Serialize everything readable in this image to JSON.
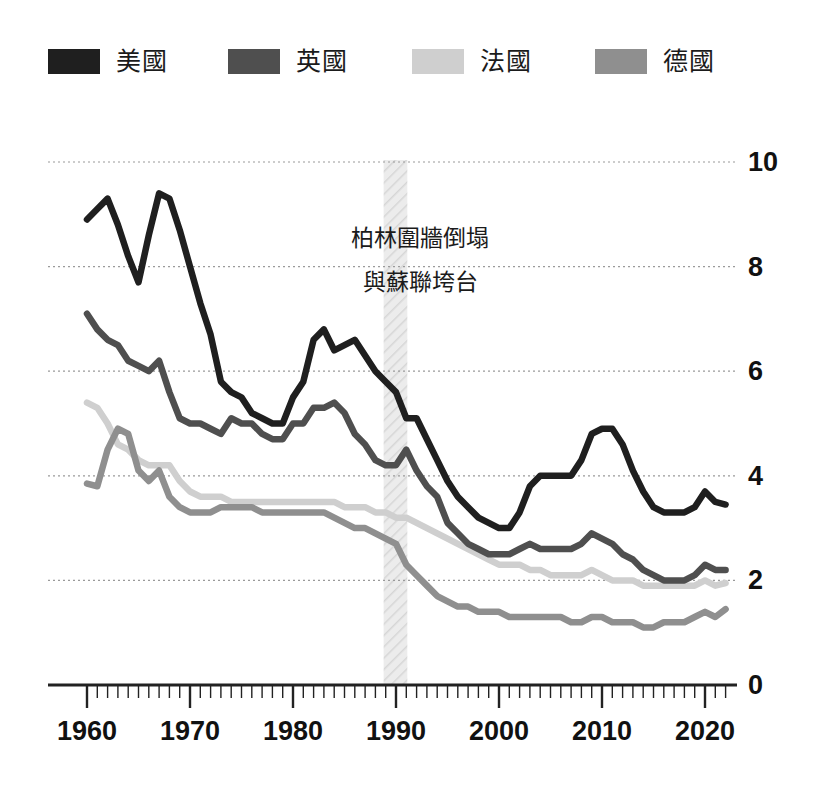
{
  "legend": {
    "items": [
      {
        "label": "美國",
        "color": "#1f1f1f",
        "key": "usa"
      },
      {
        "label": "英國",
        "color": "#4f4f4f",
        "key": "uk"
      },
      {
        "label": "法國",
        "color": "#cfcfcf",
        "key": "france"
      },
      {
        "label": "德國",
        "color": "#8f8f8f",
        "key": "germany"
      }
    ]
  },
  "annotation": {
    "line1": "柏林圍牆倒塌",
    "line2": "與蘇聯垮台",
    "band_start": 1988.8,
    "band_end": 1991.1,
    "band_color": "#e2e2e2"
  },
  "axes": {
    "y_ticks": [
      "0",
      "2",
      "4",
      "6",
      "8",
      "10"
    ],
    "x_ticks": [
      "1960",
      "1970",
      "1980",
      "1990",
      "2000",
      "2010",
      "2020"
    ]
  },
  "chart_data": {
    "type": "line",
    "title": "",
    "subtitle": "",
    "xlabel": "",
    "ylabel": "",
    "xlim": [
      1959.5,
      2022.5
    ],
    "ylim": [
      0,
      10
    ],
    "y_ticks": [
      0,
      2,
      4,
      6,
      8,
      10
    ],
    "x_ticks": [
      1960,
      1970,
      1980,
      1990,
      2000,
      2010,
      2020
    ],
    "x_minor_tick_step": 1,
    "grid": "horizontal-dotted",
    "legend_position": "top",
    "annotations": [
      {
        "text": "柏林圍牆倒塌 與蘇聯垮台",
        "type": "vertical-band",
        "x_start": 1988.8,
        "x_end": 1991.1
      }
    ],
    "x": [
      1960,
      1961,
      1962,
      1963,
      1964,
      1965,
      1966,
      1967,
      1968,
      1969,
      1970,
      1971,
      1972,
      1973,
      1974,
      1975,
      1976,
      1977,
      1978,
      1979,
      1980,
      1981,
      1982,
      1983,
      1984,
      1985,
      1986,
      1987,
      1988,
      1989,
      1990,
      1991,
      1992,
      1993,
      1994,
      1995,
      1996,
      1997,
      1998,
      1999,
      2000,
      2001,
      2002,
      2003,
      2004,
      2005,
      2006,
      2007,
      2008,
      2009,
      2010,
      2011,
      2012,
      2013,
      2014,
      2015,
      2016,
      2017,
      2018,
      2019,
      2020,
      2021,
      2022
    ],
    "series": [
      {
        "name": "美國",
        "color": "#1f1f1f",
        "values": [
          8.9,
          9.1,
          9.3,
          8.8,
          8.2,
          7.7,
          8.6,
          9.4,
          9.3,
          8.7,
          8.0,
          7.3,
          6.7,
          5.8,
          5.6,
          5.5,
          5.2,
          5.1,
          5.0,
          5.0,
          5.5,
          5.8,
          6.6,
          6.8,
          6.4,
          6.5,
          6.6,
          6.3,
          6.0,
          5.8,
          5.6,
          5.1,
          5.1,
          4.7,
          4.3,
          3.9,
          3.6,
          3.4,
          3.2,
          3.1,
          3.0,
          3.0,
          3.3,
          3.8,
          4.0,
          4.0,
          4.0,
          4.0,
          4.3,
          4.8,
          4.9,
          4.9,
          4.6,
          4.1,
          3.7,
          3.4,
          3.3,
          3.3,
          3.3,
          3.4,
          3.7,
          3.5,
          3.45
        ]
      },
      {
        "name": "英國",
        "color": "#4f4f4f",
        "values": [
          7.1,
          6.8,
          6.6,
          6.5,
          6.2,
          6.1,
          6.0,
          6.2,
          5.6,
          5.1,
          5.0,
          5.0,
          4.9,
          4.8,
          5.1,
          5.0,
          5.0,
          4.8,
          4.7,
          4.7,
          5.0,
          5.0,
          5.3,
          5.3,
          5.4,
          5.2,
          4.8,
          4.6,
          4.3,
          4.2,
          4.2,
          4.5,
          4.1,
          3.8,
          3.6,
          3.1,
          2.9,
          2.7,
          2.6,
          2.5,
          2.5,
          2.5,
          2.6,
          2.7,
          2.6,
          2.6,
          2.6,
          2.6,
          2.7,
          2.9,
          2.8,
          2.7,
          2.5,
          2.4,
          2.2,
          2.1,
          2.0,
          2.0,
          2.0,
          2.1,
          2.3,
          2.2,
          2.2
        ]
      },
      {
        "name": "法國",
        "color": "#cfcfcf",
        "values": [
          5.4,
          5.3,
          5.0,
          4.6,
          4.5,
          4.3,
          4.2,
          4.2,
          4.2,
          3.9,
          3.7,
          3.6,
          3.6,
          3.6,
          3.5,
          3.5,
          3.5,
          3.5,
          3.5,
          3.5,
          3.5,
          3.5,
          3.5,
          3.5,
          3.5,
          3.4,
          3.4,
          3.4,
          3.3,
          3.3,
          3.2,
          3.2,
          3.1,
          3.0,
          2.9,
          2.8,
          2.7,
          2.6,
          2.5,
          2.4,
          2.3,
          2.3,
          2.3,
          2.2,
          2.2,
          2.1,
          2.1,
          2.1,
          2.1,
          2.2,
          2.1,
          2.0,
          2.0,
          2.0,
          1.9,
          1.9,
          1.9,
          1.9,
          1.9,
          1.9,
          2.0,
          1.9,
          1.95
        ]
      },
      {
        "name": "德國",
        "color": "#8f8f8f",
        "values": [
          3.85,
          3.8,
          4.5,
          4.9,
          4.8,
          4.1,
          3.9,
          4.1,
          3.6,
          3.4,
          3.3,
          3.3,
          3.3,
          3.4,
          3.4,
          3.4,
          3.4,
          3.3,
          3.3,
          3.3,
          3.3,
          3.3,
          3.3,
          3.3,
          3.2,
          3.1,
          3.0,
          3.0,
          2.9,
          2.8,
          2.7,
          2.3,
          2.1,
          1.9,
          1.7,
          1.6,
          1.5,
          1.5,
          1.4,
          1.4,
          1.4,
          1.3,
          1.3,
          1.3,
          1.3,
          1.3,
          1.3,
          1.2,
          1.2,
          1.3,
          1.3,
          1.2,
          1.2,
          1.2,
          1.1,
          1.1,
          1.2,
          1.2,
          1.2,
          1.3,
          1.4,
          1.3,
          1.45
        ]
      }
    ]
  }
}
